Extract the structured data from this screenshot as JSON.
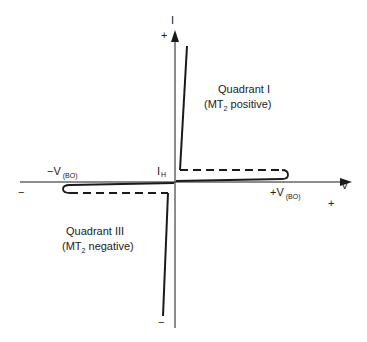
{
  "diagram": {
    "type": "triac-iv-characteristic",
    "axes": {
      "y_label": "I",
      "x_label": "V",
      "y_plus": "+",
      "y_minus": "−",
      "x_plus": "+",
      "x_minus": "−"
    },
    "labels": {
      "neg_breakover_main": "−V",
      "neg_breakover_sub": "(BO)",
      "pos_breakover_main": "+V",
      "pos_breakover_sub": "(BO)",
      "holding_current_main": "I",
      "holding_current_sub": "H"
    },
    "quadrants": {
      "q1_title": "Quadrant I",
      "q1_desc_pre": "(MT",
      "q1_desc_sub": "2",
      "q1_desc_post": " positive)",
      "q3_title": "Quadrant III",
      "q3_desc_pre": "(MT",
      "q3_desc_sub": "2",
      "q3_desc_post": " negative)"
    },
    "colors": {
      "line": "#1a1a1a",
      "background": "#ffffff"
    }
  }
}
